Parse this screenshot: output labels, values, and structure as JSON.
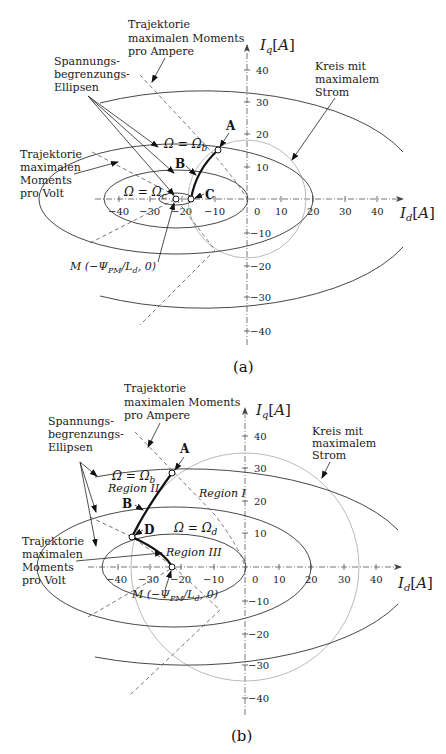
{
  "panel_a": {
    "caption": "(a)",
    "axis_x_label": "I_d[A]",
    "axis_y_label": "I_q[A]",
    "x_ticks": [
      "−40",
      "−30",
      "−20",
      "−10",
      "0",
      "10",
      "20",
      "30",
      "40"
    ],
    "y_ticks": [
      "40",
      "30",
      "20",
      "10",
      "−10",
      "−20",
      "−30",
      "−40"
    ],
    "label_mtpa": [
      "Trajektorie",
      "maximalen Moments",
      "pro Ampere"
    ],
    "label_ellipses": [
      "Spannungs-",
      "begrenzungs-",
      "Ellipsen"
    ],
    "label_mtpv": [
      "Trajektorie",
      "maximalen",
      "Moments",
      "pro Volt"
    ],
    "label_circle": [
      "Kreis mit",
      "maximalem",
      "Strom"
    ],
    "omega_b": "Ω = Ωb",
    "omega_c": "Ω = Ωc",
    "point_a": "A",
    "point_b": "B",
    "point_c": "C",
    "point_m": "M (−ΨPM/Ld, 0)"
  },
  "panel_b": {
    "caption": "(b)",
    "axis_x_label": "I_d[A]",
    "axis_y_label": "I_q[A]",
    "x_ticks": [
      "−40",
      "−30",
      "−20",
      "−10",
      "0",
      "10",
      "20",
      "30",
      "40"
    ],
    "y_ticks": [
      "40",
      "30",
      "20",
      "10",
      "−10",
      "−20",
      "−30",
      "−40"
    ],
    "label_mtpa": [
      "Trajektorie",
      "maximalen Moments",
      "pro Ampere"
    ],
    "label_ellipses": [
      "Spannungs-",
      "begrenzungs-",
      "Ellipsen"
    ],
    "label_mtpv": [
      "Trajektorie",
      "maximalen",
      "Moments",
      "pro Volt"
    ],
    "label_circle": [
      "Kreis mit",
      "maximalem",
      "Strom"
    ],
    "omega_b": "Ω = Ωb",
    "omega_d": "Ω = Ωd",
    "region_1": "Region I",
    "region_2": "Region II",
    "region_3": "Region III",
    "point_a": "A",
    "point_b": "B",
    "point_d": "D",
    "point_m": "M (−ΨPM/Ld, 0)"
  }
}
